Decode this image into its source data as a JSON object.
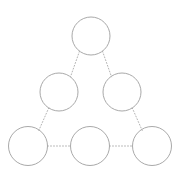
{
  "canvas": {
    "width": 182,
    "height": 190,
    "background_color": "#ffffff",
    "title": "Triangular node diagram"
  },
  "style": {
    "node_stroke_color": "#a9a9a9",
    "node_stroke_width": 1,
    "node_fill_color": "none",
    "connector_stroke_color": "#b4b4b4",
    "connector_stroke_width": 1,
    "connector_dash_pattern": "1 2"
  },
  "diagram": {
    "type": "triangular-pyramid-graph",
    "row_count": 3,
    "node_count": 6,
    "connector_count": 6,
    "nodes": [
      {
        "id": "node-apex",
        "label": "",
        "row": 1,
        "index": 0,
        "cx": 91,
        "cy": 36,
        "r": 19
      },
      {
        "id": "node-mid-left",
        "label": "",
        "row": 2,
        "index": 0,
        "cx": 59,
        "cy": 92,
        "r": 19
      },
      {
        "id": "node-mid-right",
        "label": "",
        "row": 2,
        "index": 1,
        "cx": 122,
        "cy": 92,
        "r": 19
      },
      {
        "id": "node-bottom-left",
        "label": "",
        "row": 3,
        "index": 0,
        "cx": 28,
        "cy": 146,
        "r": 19.5
      },
      {
        "id": "node-bottom-center",
        "label": "",
        "row": 3,
        "index": 1,
        "cx": 90,
        "cy": 146,
        "r": 19.5
      },
      {
        "id": "node-bottom-right",
        "label": "",
        "row": 3,
        "index": 2,
        "cx": 152,
        "cy": 146,
        "r": 19.5
      }
    ],
    "connectors": [
      {
        "id": "connector-apex-to-mid-left",
        "from": "node-apex",
        "to": "node-mid-left",
        "x1": 79.5,
        "y1": 51.2,
        "x2": 70.5,
        "y2": 76.8
      },
      {
        "id": "connector-apex-to-mid-right",
        "from": "node-apex",
        "to": "node-mid-right",
        "x1": 102.5,
        "y1": 51.2,
        "x2": 111.5,
        "y2": 76.8
      },
      {
        "id": "connector-mid-left-to-bottom-left",
        "from": "node-mid-left",
        "to": "node-bottom-left",
        "x1": 48.8,
        "y1": 107.8,
        "x2": 38.8,
        "y2": 130.5
      },
      {
        "id": "connector-mid-right-to-bottom-right",
        "from": "node-mid-right",
        "to": "node-bottom-right",
        "x1": 132.2,
        "y1": 107.8,
        "x2": 142.2,
        "y2": 130.5
      },
      {
        "id": "connector-bottom-left-to-center",
        "from": "node-bottom-left",
        "to": "node-bottom-center",
        "x1": 47.5,
        "y1": 146,
        "x2": 70.5,
        "y2": 146
      },
      {
        "id": "connector-bottom-center-to-right",
        "from": "node-bottom-center",
        "to": "node-bottom-right",
        "x1": 109.5,
        "y1": 146,
        "x2": 132.5,
        "y2": 146
      }
    ]
  }
}
